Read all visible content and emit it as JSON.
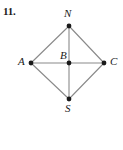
{
  "problem": {
    "number": "11."
  },
  "figure": {
    "type": "geometry-diagram",
    "shape_name": "rhombus-with-diagonals",
    "background_color": "#ffffff",
    "line_color": "#8a8a8a",
    "point_color": "#1a1a1a",
    "label_color": "#1a1a1a",
    "points": [
      {
        "id": "N",
        "label": "N",
        "x": 69,
        "y": 26,
        "label_x": 64,
        "label_y": 8
      },
      {
        "id": "A",
        "label": "A",
        "x": 31,
        "y": 63,
        "label_x": 18,
        "label_y": 56
      },
      {
        "id": "B",
        "label": "B",
        "x": 69,
        "y": 63,
        "label_x": 60,
        "label_y": 50
      },
      {
        "id": "C",
        "label": "C",
        "x": 104,
        "y": 63,
        "label_x": 110,
        "label_y": 56
      },
      {
        "id": "S",
        "label": "S",
        "x": 69,
        "y": 99,
        "label_x": 65,
        "label_y": 103
      }
    ],
    "segments": [
      {
        "from": "A",
        "to": "N"
      },
      {
        "from": "N",
        "to": "C"
      },
      {
        "from": "C",
        "to": "S"
      },
      {
        "from": "S",
        "to": "A"
      },
      {
        "from": "A",
        "to": "C"
      },
      {
        "from": "N",
        "to": "S"
      }
    ]
  }
}
